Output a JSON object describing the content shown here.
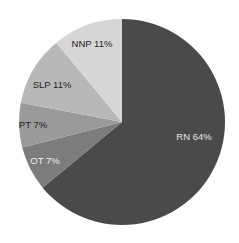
{
  "chart_data": {
    "type": "pie",
    "title": "",
    "start_angle_deg": 0,
    "direction": "clockwise",
    "slices": [
      {
        "label": "RN",
        "value": 64,
        "text": "RN 64%",
        "color": "#4a4a4a",
        "text_color": "#e6e6e6",
        "lx": 194,
        "ly": 140
      },
      {
        "label": "OT",
        "value": 7,
        "text": "OT 7%",
        "color": "#7c7c7c",
        "text_color": "#ececec",
        "lx": 45,
        "ly": 164
      },
      {
        "label": "PT",
        "value": 7,
        "text": "PT 7%",
        "color": "#9a9a9a",
        "text_color": "#222222",
        "lx": 33,
        "ly": 128
      },
      {
        "label": "SLP",
        "value": 11,
        "text": "SLP 11%",
        "color": "#b8b8b8",
        "text_color": "#222222",
        "lx": 52,
        "ly": 88
      },
      {
        "label": "NNP",
        "value": 11,
        "text": "NNP 11%",
        "color": "#d6d6d6",
        "text_color": "#222222",
        "lx": 92,
        "ly": 47
      }
    ],
    "center": [
      122,
      122
    ],
    "radius": 103
  }
}
